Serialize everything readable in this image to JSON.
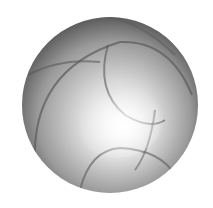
{
  "figure": {
    "sphere": {
      "cx": 110,
      "cy": 105,
      "r": 88
    },
    "colors": {
      "background": "#ffffff",
      "highlight": "#ffffff",
      "midtone": "#b4b4b4",
      "shadow": "#3c3c3c",
      "band_stroke": "#5a5a5a"
    }
  }
}
